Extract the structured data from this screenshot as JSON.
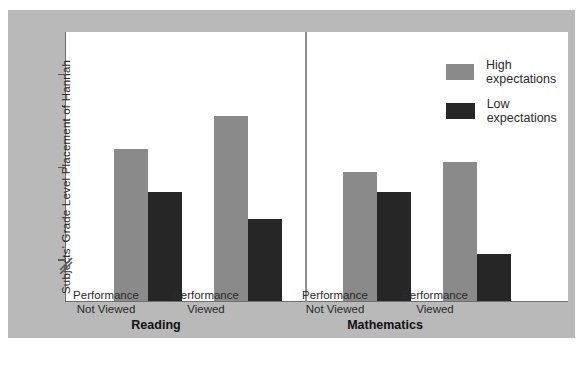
{
  "chart_data": {
    "type": "bar",
    "title": "",
    "xlabel": "",
    "ylabel": "Subjects' Grade Level Placement of Hannah",
    "ylim": [
      2.55,
      5.45
    ],
    "yticks": [
      3,
      4,
      5
    ],
    "ytick_labels": [
      "3",
      "4",
      "5"
    ],
    "axis_break": true,
    "grid": false,
    "legend_position": "top-right",
    "panels": [
      {
        "name": "Reading",
        "categories": [
          "Performance Not Viewed",
          "Performance Viewed"
        ]
      },
      {
        "name": "Mathematics",
        "categories": [
          "Performance Not Viewed",
          "Performance Viewed"
        ]
      }
    ],
    "categories": [
      "Reading / Performance Not Viewed",
      "Reading / Performance Viewed",
      "Mathematics / Performance Not Viewed",
      "Mathematics / Performance Viewed"
    ],
    "series": [
      {
        "name": "High expectations",
        "color": "#8a8a8a",
        "values": [
          4.19,
          4.54,
          3.94,
          4.05
        ]
      },
      {
        "name": "Low expectations",
        "color": "#262626",
        "values": [
          3.73,
          3.43,
          3.73,
          3.06
        ]
      }
    ]
  },
  "ticks": [
    {
      "label": "5",
      "value": 5
    },
    {
      "label": "4",
      "value": 4
    },
    {
      "label": "3",
      "value": 3
    }
  ],
  "legend": {
    "items": [
      {
        "label": "High expectations",
        "color": "#8a8a8a"
      },
      {
        "label": "Low expectations",
        "color": "#262626"
      }
    ]
  },
  "axis": {
    "y_title": "Subjects' Grade Level Placement of Hannah"
  },
  "groups": [
    {
      "line1": "Performance",
      "line2": "Not Viewed",
      "subject": "Reading"
    },
    {
      "line1": "Performance",
      "line2": "Viewed",
      "subject": "Reading"
    },
    {
      "line1": "Performance",
      "line2": "Not Viewed",
      "subject": "Mathematics"
    },
    {
      "line1": "Performance",
      "line2": "Viewed",
      "subject": "Mathematics"
    }
  ],
  "subjects": [
    {
      "label": "Reading"
    },
    {
      "label": "Mathematics"
    }
  ]
}
